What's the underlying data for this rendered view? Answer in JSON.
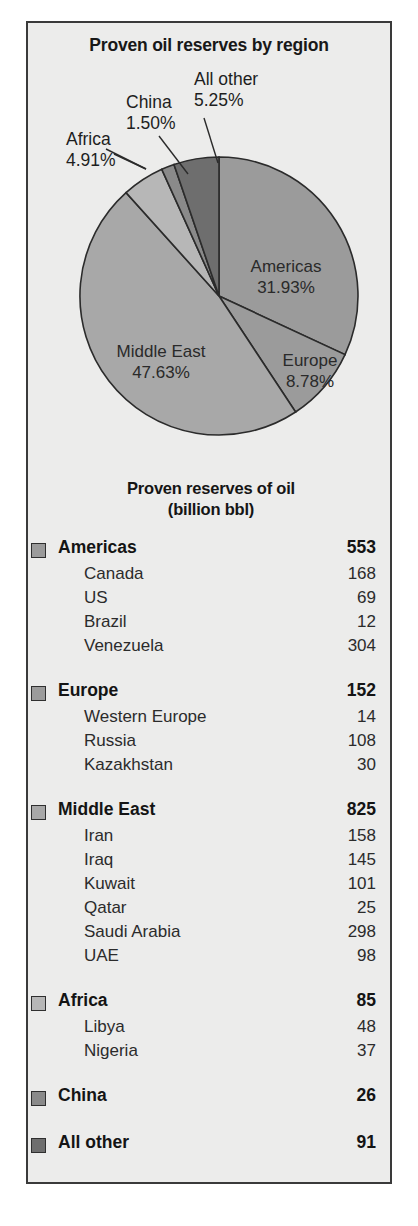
{
  "panel": {
    "background_color": "#ececeb",
    "border_color": "#3a3a3a"
  },
  "chart_title": "Proven oil reserves by region",
  "table": {
    "title_line1": "Proven reserves of oil",
    "title_line2": "(billion bbl)",
    "groups": [
      {
        "name": "Americas",
        "value": "553",
        "swatch_color": "#9b9b9b",
        "items": [
          {
            "name": "Canada",
            "value": "168"
          },
          {
            "name": "US",
            "value": "69"
          },
          {
            "name": "Brazil",
            "value": "12"
          },
          {
            "name": "Venezuela",
            "value": "304"
          }
        ]
      },
      {
        "name": "Europe",
        "value": "152",
        "swatch_color": "#9b9b9b",
        "items": [
          {
            "name": "Western Europe",
            "value": "14"
          },
          {
            "name": "Russia",
            "value": "108"
          },
          {
            "name": "Kazakhstan",
            "value": "30"
          }
        ]
      },
      {
        "name": "Middle East",
        "value": "825",
        "swatch_color": "#a8a8a8",
        "items": [
          {
            "name": "Iran",
            "value": "158"
          },
          {
            "name": "Iraq",
            "value": "145"
          },
          {
            "name": "Kuwait",
            "value": "101"
          },
          {
            "name": "Qatar",
            "value": "25"
          },
          {
            "name": "Saudi Arabia",
            "value": "298"
          },
          {
            "name": "UAE",
            "value": "98"
          }
        ]
      },
      {
        "name": "Africa",
        "value": "85",
        "swatch_color": "#b7b7b7",
        "items": [
          {
            "name": "Libya",
            "value": "48"
          },
          {
            "name": "Nigeria",
            "value": "37"
          }
        ]
      },
      {
        "name": "China",
        "value": "26",
        "swatch_color": "#8a8a8a",
        "items": []
      },
      {
        "name": "All other",
        "value": "91",
        "swatch_color": "#6e6e6e",
        "items": []
      }
    ]
  },
  "chart_data": {
    "type": "pie",
    "title": "Proven oil reserves by region",
    "unit": "percent",
    "legend_position": "none",
    "grid": false,
    "start_angle_deg": 0,
    "direction": "clockwise",
    "center": {
      "x": 191,
      "y": 273
    },
    "radius": 139,
    "categories": [
      "Americas",
      "Europe",
      "Middle East",
      "Africa",
      "China",
      "All other"
    ],
    "values": [
      31.93,
      8.78,
      47.63,
      4.91,
      1.5,
      5.25
    ],
    "colors": [
      "#9b9b9b",
      "#9b9b9b",
      "#a8a8a8",
      "#b7b7b7",
      "#8a8a8a",
      "#6e6e6e"
    ],
    "slices": [
      {
        "label": "Americas",
        "value": 31.93,
        "label_text": "Americas",
        "value_text": "31.93%",
        "color": "#9b9b9b",
        "label_placement": "inside",
        "label_x": 258,
        "label_y": 249
      },
      {
        "label": "Europe",
        "value": 8.78,
        "label_text": "Europe",
        "value_text": "8.78%",
        "color": "#9b9b9b",
        "label_placement": "inside",
        "label_x": 282,
        "label_y": 343
      },
      {
        "label": "Middle East",
        "value": 47.63,
        "label_text": "Middle East",
        "value_text": "47.63%",
        "color": "#a8a8a8",
        "label_placement": "inside",
        "label_x": 133,
        "label_y": 334
      },
      {
        "label": "Africa",
        "value": 4.91,
        "label_text": "Africa",
        "value_text": "4.91%",
        "color": "#b7b7b7",
        "label_placement": "callout",
        "label_x": 38,
        "label_y": 122
      },
      {
        "label": "China",
        "value": 1.5,
        "label_text": "China",
        "value_text": "1.50%",
        "color": "#8a8a8a",
        "label_placement": "callout",
        "label_x": 98,
        "label_y": 85
      },
      {
        "label": "All other",
        "value": 5.25,
        "label_text": "All other",
        "value_text": "5.25%",
        "color": "#6e6e6e",
        "label_placement": "callout",
        "label_x": 166,
        "label_y": 62
      }
    ],
    "table_title": "Proven reserves of oil (billion bbl)",
    "table_categories": [
      "Americas",
      "Europe",
      "Middle East",
      "Africa",
      "China",
      "All other"
    ],
    "table_values": [
      553,
      152,
      825,
      85,
      26,
      91
    ]
  }
}
